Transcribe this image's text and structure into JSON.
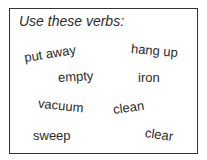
{
  "instruction": "Use these verbs:",
  "verbs": [
    {
      "text": "put away",
      "x": 24,
      "y": 46,
      "rot": -9
    },
    {
      "text": "hang up",
      "x": 131,
      "y": 43,
      "rot": 5
    },
    {
      "text": "empty",
      "x": 58,
      "y": 69,
      "rot": -3
    },
    {
      "text": "iron",
      "x": 138,
      "y": 70,
      "rot": 0
    },
    {
      "text": "vacuum",
      "x": 38,
      "y": 98,
      "rot": 6
    },
    {
      "text": "clean",
      "x": 113,
      "y": 100,
      "rot": -8
    },
    {
      "text": "sweep",
      "x": 33,
      "y": 128,
      "rot": 0
    },
    {
      "text": "clear",
      "x": 145,
      "y": 127,
      "rot": 8
    }
  ]
}
